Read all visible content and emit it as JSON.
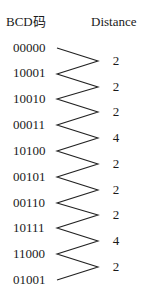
{
  "headers": {
    "code": "BCD码",
    "distance": "Distance"
  },
  "codes": [
    "00000",
    "10001",
    "10010",
    "00011",
    "10100",
    "00101",
    "00110",
    "10111",
    "11000",
    "01001"
  ],
  "distances": [
    "2",
    "2",
    "2",
    "4",
    "2",
    "2",
    "2",
    "4",
    "2"
  ],
  "colors": {
    "line": "#222222",
    "text": "#1a1a1a",
    "background": "#ffffff"
  }
}
